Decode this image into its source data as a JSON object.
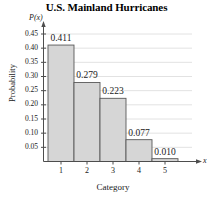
{
  "chart_data": {
    "type": "bar",
    "title": "U.S. Mainland Hurricanes",
    "xlabel": "Category",
    "ylabel": "Probability",
    "x_axis_variable": "x",
    "y_axis_variable": "P(x)",
    "categories": [
      "1",
      "2",
      "3",
      "4",
      "5"
    ],
    "values": [
      0.411,
      0.279,
      0.223,
      0.077,
      0.01
    ],
    "value_labels": [
      "0.411",
      "0.279",
      "0.223",
      "0.077",
      "0.010"
    ],
    "ylim": [
      0,
      0.47
    ],
    "y_ticks": [
      0.05,
      0.1,
      0.15,
      0.2,
      0.25,
      0.3,
      0.35,
      0.4,
      0.45
    ],
    "y_tick_labels": [
      "0.05",
      "0.10",
      "0.15",
      "0.20",
      "0.25",
      "0.30",
      "0.35",
      "0.40",
      "0.45"
    ],
    "grid": true,
    "grid_orientation": "horizontal",
    "legend": false,
    "bar_fill_color": "#d6d6d6",
    "bar_edge_color": "#595959",
    "grid_color": "#e2e2e2",
    "axis_color": "#4d4d4d",
    "text_color": "#1a1a1a"
  }
}
